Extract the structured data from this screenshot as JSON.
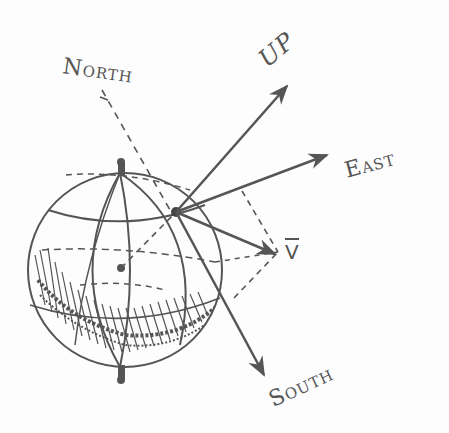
{
  "diagram": {
    "labels": {
      "north": {
        "first": "N",
        "rest": "ORTH"
      },
      "up": "UP",
      "east": {
        "first": "E",
        "rest": "AST"
      },
      "south": {
        "first": "S",
        "rest": "OUTH"
      },
      "vector": "V"
    },
    "colors": {
      "ink": "#555555",
      "background": "#fdfdfd"
    },
    "elements": [
      "globe with latitude and longitude lines",
      "shaded southern hemisphere",
      "north axis dashed line",
      "point on surface",
      "up arrow",
      "east arrow",
      "south arrow",
      "vector V arrow with dashed projections"
    ]
  }
}
